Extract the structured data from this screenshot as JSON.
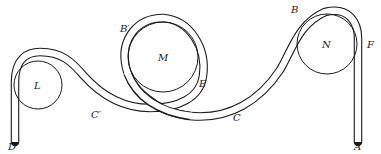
{
  "figure": {
    "colors": {
      "ink": "#1a1a1a",
      "background": "#ffffff"
    },
    "pulleys": [
      {
        "id": "L",
        "label": "L",
        "cx": 38,
        "cy": 85,
        "r": 24
      },
      {
        "id": "M",
        "label": "M",
        "cx": 163,
        "cy": 57,
        "r": 35
      },
      {
        "id": "N",
        "label": "N",
        "cx": 327,
        "cy": 44,
        "r": 30
      }
    ],
    "points": [
      {
        "id": "A",
        "label": "A",
        "x": 354,
        "y": 146
      },
      {
        "id": "B",
        "label": "B",
        "x": 292,
        "y": 15
      },
      {
        "id": "B_prime",
        "label": "B′",
        "x": 120,
        "y": 33
      },
      {
        "id": "C",
        "label": "C",
        "x": 232,
        "y": 122
      },
      {
        "id": "C_prime",
        "label": "C′",
        "x": 92,
        "y": 118
      },
      {
        "id": "D",
        "label": "D",
        "x": 8,
        "y": 146
      },
      {
        "id": "E",
        "label": "E",
        "x": 200,
        "y": 86
      },
      {
        "id": "F",
        "label": "F",
        "x": 368,
        "y": 48
      }
    ]
  }
}
